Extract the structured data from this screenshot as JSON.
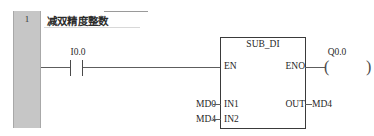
{
  "network": {
    "number": "1",
    "title": "减双精度整数"
  },
  "rung": {
    "contact": {
      "type": "normally-open-contact",
      "label": "I0.0"
    },
    "coil": {
      "type": "output-coil",
      "label": "Q0.0",
      "left_paren": "(",
      "right_paren": ")"
    }
  },
  "block": {
    "name": "SUB_DI",
    "pins": {
      "en": "EN",
      "eno": "ENO",
      "in1": "IN1",
      "in2": "IN2",
      "out": "OUT"
    },
    "operands": {
      "in1": "MD0",
      "in2": "MD4",
      "out": "MD4"
    }
  },
  "colors": {
    "network_bar": "#c6c6c6",
    "wire": "#5d5d5d",
    "block_border": "#3a3a3a",
    "text": "#1f1f1f",
    "background": "#ffffff"
  }
}
